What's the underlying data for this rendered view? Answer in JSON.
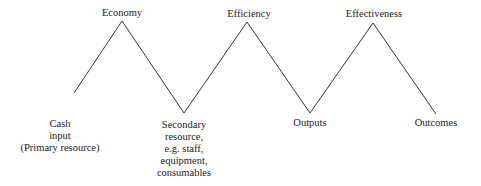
{
  "diagram": {
    "peaks": [
      {
        "label": "Economy",
        "x": 122,
        "y": 21
      },
      {
        "label": "Efficiency",
        "x": 247,
        "y": 22
      },
      {
        "label": "Effectiveness",
        "x": 373,
        "y": 23
      }
    ],
    "valleys": [
      {
        "label": "Cash\ninput\n(Primary resource)",
        "x": 60,
        "y": 114
      },
      {
        "label": "Secondary\nresource,\ne.g. staff,\nequipment,\nconsumables",
        "x": 184,
        "y": 113
      },
      {
        "label": "Outputs",
        "x": 310,
        "y": 113
      },
      {
        "label": "Outcomes",
        "x": 436,
        "y": 114
      }
    ],
    "line_color": "#333333"
  }
}
